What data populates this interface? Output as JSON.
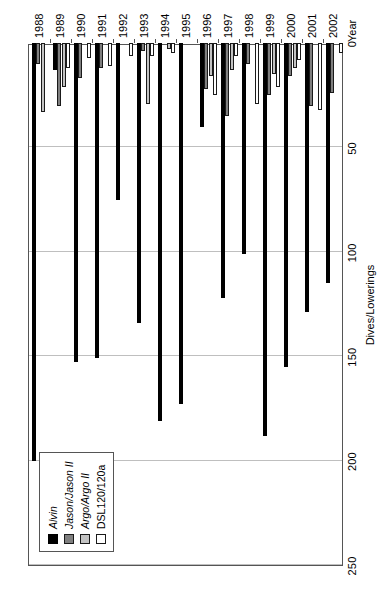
{
  "chart_data": {
    "type": "bar",
    "orientation": "horizontal-rotated",
    "title": "",
    "xlabel": "Year",
    "ylabel": "Dives/Lowerings",
    "ylim": [
      0,
      250
    ],
    "yticks": [
      0,
      50,
      100,
      150,
      200,
      250
    ],
    "grid": true,
    "legend_position": "top-left",
    "categories": [
      "1988",
      "1989",
      "1990",
      "1991",
      "1992",
      "1993",
      "1994",
      "1995",
      "1996",
      "1997",
      "1998",
      "1999",
      "2000",
      "2001",
      "2002"
    ],
    "series": [
      {
        "name": "Alvin",
        "color": "#000000",
        "values": [
          200,
          13,
          153,
          151,
          75,
          134,
          181,
          173,
          40,
          122,
          101,
          188,
          155,
          129,
          115
        ]
      },
      {
        "name": "Jason/Jason II",
        "color": "#7f7f7f",
        "values": [
          10,
          30,
          17,
          12,
          0,
          4,
          0,
          0,
          22,
          35,
          10,
          25,
          16,
          30,
          24
        ]
      },
      {
        "name": "Argo/Argo II",
        "color": "#c3c3c3",
        "values": [
          33,
          21,
          0,
          0,
          0,
          29,
          3,
          0,
          16,
          13,
          0,
          15,
          12,
          0,
          0
        ]
      },
      {
        "name": "DSL120/120a",
        "color": "#ffffff",
        "values": [
          0,
          12,
          7,
          11,
          6,
          6,
          5,
          0,
          25,
          6,
          29,
          21,
          8,
          32,
          5
        ]
      }
    ]
  },
  "legend": {
    "items": [
      {
        "label": "Alvin",
        "style": "italic"
      },
      {
        "label": "Jason/Jason II",
        "style": "italic"
      },
      {
        "label": "Argo/Argo II",
        "style": "italic"
      },
      {
        "label": "DSL120/120a",
        "style": "normal"
      }
    ]
  },
  "axes": {
    "value_axis": {
      "title": "Dives/Lowerings",
      "ticks": [
        "250",
        "200",
        "150",
        "100",
        "50",
        "0"
      ]
    },
    "category_axis": {
      "title": "Year",
      "ticks": [
        "1988",
        "1989",
        "1990",
        "1991",
        "1992",
        "1993",
        "1994",
        "1995",
        "1996",
        "1997",
        "1998",
        "1999",
        "2000",
        "2001",
        "2002"
      ]
    }
  },
  "colors": {
    "series_alvin": "#000000",
    "series_jason": "#7f7f7f",
    "series_argo": "#c3c3c3",
    "series_dsl": "#ffffff",
    "gridline": "#bfbfbf",
    "frame": "#555555",
    "background": "#ffffff"
  }
}
